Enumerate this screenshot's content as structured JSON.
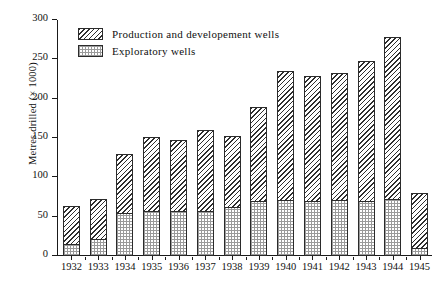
{
  "chart_data": {
    "type": "bar",
    "subtype": "stacked-bar",
    "title": "",
    "xlabel": "",
    "ylabel": "Metres drilled (× 1000)",
    "categories": [
      "1932",
      "1933",
      "1934",
      "1935",
      "1936",
      "1937",
      "1938",
      "1939",
      "1940",
      "1941",
      "1942",
      "1943",
      "1944",
      "1945"
    ],
    "series": [
      {
        "name": "Exploratory wells",
        "values": [
          15,
          22,
          55,
          57,
          57,
          57,
          62,
          70,
          71,
          70,
          71,
          70,
          73,
          10
        ]
      },
      {
        "name": "Production and developement wells",
        "values": [
          48,
          51,
          75,
          94,
          91,
          103,
          91,
          120,
          164,
          159,
          162,
          178,
          206,
          70
        ]
      }
    ],
    "totals": [
      63,
      73,
      130,
      151,
      148,
      160,
      153,
      190,
      235,
      229,
      233,
      248,
      279,
      80
    ],
    "ylim": [
      0,
      300
    ],
    "yticks": [
      0,
      50,
      100,
      150,
      200,
      250,
      300
    ],
    "grid": false,
    "legend_position": "top-left"
  },
  "axes": {
    "y_title": "Metres drilled (× 1000)",
    "y_tick_labels": [
      "0",
      "50",
      "100",
      "150",
      "200",
      "250",
      "300"
    ],
    "x_tick_labels": [
      "1932",
      "1933",
      "1934",
      "1935",
      "1936",
      "1937",
      "1938",
      "1939",
      "1940",
      "1941",
      "1942",
      "1943",
      "1944",
      "1945"
    ]
  },
  "legend": {
    "items": [
      {
        "label": "Production and developement wells",
        "pattern": "diagonal-hatch"
      },
      {
        "label": "Exploratory wells",
        "pattern": "stipple"
      }
    ]
  },
  "colors": {
    "axis": "#1a1a1a",
    "hatch": "#2e2e2e",
    "stipple": "#9a9a9a",
    "background": "#ffffff"
  }
}
